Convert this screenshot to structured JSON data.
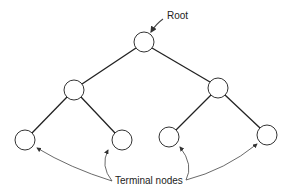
{
  "diagram": {
    "type": "binary-tree",
    "labels": {
      "root": "Root",
      "terminal": "Terminal nodes"
    },
    "nodes": [
      {
        "id": "root",
        "x": 144,
        "y": 42
      },
      {
        "id": "left",
        "x": 74,
        "y": 90
      },
      {
        "id": "right",
        "x": 218,
        "y": 88
      },
      {
        "id": "leaf1",
        "x": 25,
        "y": 140
      },
      {
        "id": "leaf2",
        "x": 122,
        "y": 140
      },
      {
        "id": "leaf3",
        "x": 169,
        "y": 137
      },
      {
        "id": "leaf4",
        "x": 267,
        "y": 135
      }
    ],
    "edges": [
      [
        "root",
        "left"
      ],
      [
        "root",
        "right"
      ],
      [
        "left",
        "leaf1"
      ],
      [
        "left",
        "leaf2"
      ],
      [
        "right",
        "leaf3"
      ],
      [
        "right",
        "leaf4"
      ]
    ],
    "colors": {
      "line": "#222222",
      "background": "#ffffff"
    }
  }
}
